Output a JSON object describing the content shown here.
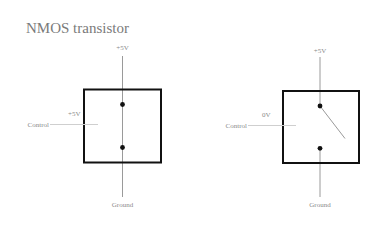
{
  "title": "NMOS transistor",
  "diagrams": [
    {
      "state": "on",
      "supply_label": "+5V",
      "control_label": "Control",
      "control_voltage": "+5V",
      "ground_label": "Ground",
      "switch": "closed"
    },
    {
      "state": "off",
      "supply_label": "+5V",
      "control_label": "Control",
      "control_voltage": "0V",
      "ground_label": "Ground",
      "switch": "open"
    }
  ],
  "colors": {
    "box": "#111111",
    "wire": "#9a9a9a",
    "control_wire": "#cfcfcf",
    "text": "#8a8a8a"
  }
}
